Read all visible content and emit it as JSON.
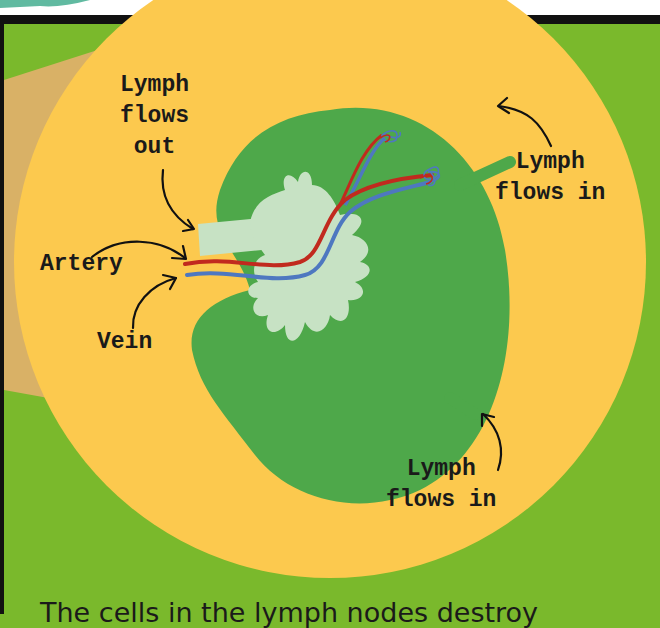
{
  "diagram": {
    "colors": {
      "background_green": "#7ab92c",
      "outer_circle_yellow": "#fcc94e",
      "node_green": "#4ea84a",
      "medulla_pale": "#c7e2c4",
      "artery_red": "#c12a1e",
      "vein_blue": "#4e78c0",
      "magnify_cone": "#d9b166",
      "frame_black": "#111111"
    },
    "labels": {
      "lymph_out": "Lymph\nflows\nout",
      "artery": "Artery",
      "vein": "Vein",
      "lymph_in_top": "Lymph\nflows in",
      "lymph_in_bottom": "Lymph\nflows in"
    },
    "caption": "The cells in the lymph nodes destroy"
  }
}
